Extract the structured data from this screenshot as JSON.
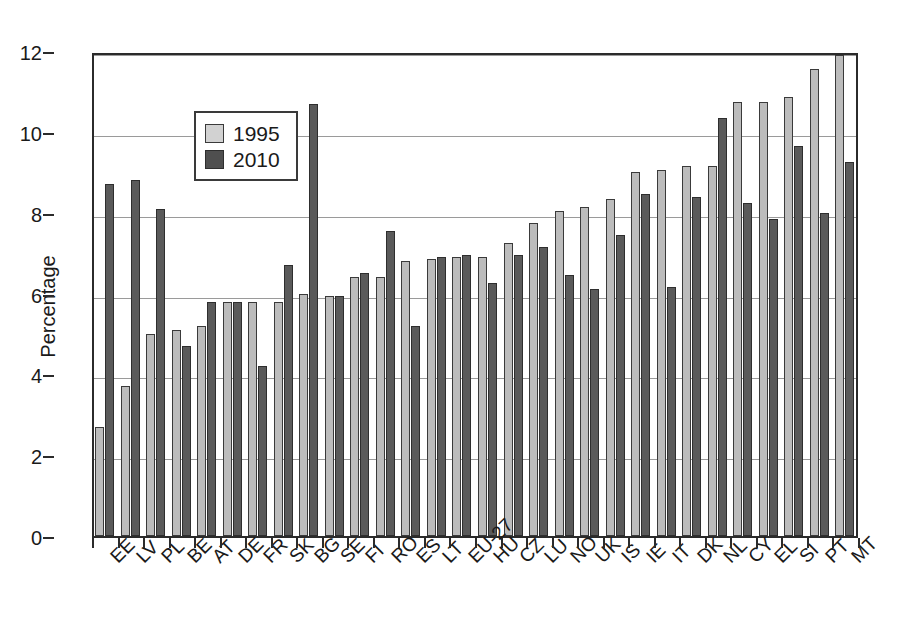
{
  "chart_data": {
    "type": "bar",
    "title": "",
    "subtitle": "",
    "xlabel": "",
    "ylabel": "Percentage",
    "ylim": [
      0,
      12
    ],
    "y_ticks": [
      0,
      2,
      4,
      6,
      8,
      10,
      12
    ],
    "grid": "horizontal",
    "legend_position": "top-left",
    "categories": [
      "EE",
      "LV",
      "PL",
      "BE",
      "AT",
      "DE",
      "FR",
      "SK",
      "BG",
      "SE",
      "FI",
      "RO",
      "ES",
      "LT",
      "EU-27",
      "HU",
      "CZ",
      "LU",
      "NO",
      "UK",
      "IS",
      "IE",
      "IT",
      "DK",
      "NL",
      "CY",
      "EL",
      "SI",
      "PT",
      "MT"
    ],
    "series": [
      {
        "name": "1995",
        "color": "#bcbcbc",
        "values": [
          2.7,
          3.7,
          5.0,
          5.1,
          5.2,
          5.8,
          5.8,
          5.8,
          6.0,
          5.95,
          6.4,
          6.4,
          6.8,
          6.85,
          6.9,
          6.9,
          7.25,
          7.75,
          8.05,
          8.15,
          8.35,
          9.0,
          9.05,
          9.15,
          9.15,
          10.75,
          10.75,
          10.85,
          11.55,
          11.9
        ]
      },
      {
        "name": "2010",
        "color": "#5a5a5a",
        "values": [
          8.7,
          8.8,
          8.1,
          4.7,
          5.8,
          5.8,
          4.2,
          6.7,
          10.7,
          5.95,
          6.5,
          7.55,
          5.2,
          6.9,
          6.95,
          6.25,
          6.95,
          7.15,
          6.45,
          6.1,
          7.45,
          8.45,
          6.15,
          8.4,
          10.35,
          8.25,
          7.85,
          9.65,
          8.0,
          9.25
        ]
      }
    ]
  },
  "legend": {
    "entries": [
      {
        "label": "1995",
        "swatch": "light-gray-swatch"
      },
      {
        "label": "2010",
        "swatch": "dark-gray-swatch"
      }
    ]
  },
  "axes": {
    "y_title": "Percentage",
    "y_tick_labels": [
      "0",
      "2",
      "4",
      "6",
      "8",
      "10",
      "12"
    ]
  }
}
